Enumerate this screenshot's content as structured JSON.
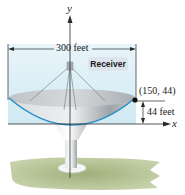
{
  "figure": {
    "width_label": "300 feet",
    "receiver_label": "Receiver",
    "point_label": "(150, 44)",
    "depth_label": "44 feet",
    "x_axis_label": "x",
    "y_axis_label": "y"
  },
  "colors": {
    "sky": "#d8eef6",
    "parabola": "#2a8fc8",
    "dish": "#c9cccf",
    "ground": "#b9c79a",
    "axis": "#2a2a2a"
  }
}
